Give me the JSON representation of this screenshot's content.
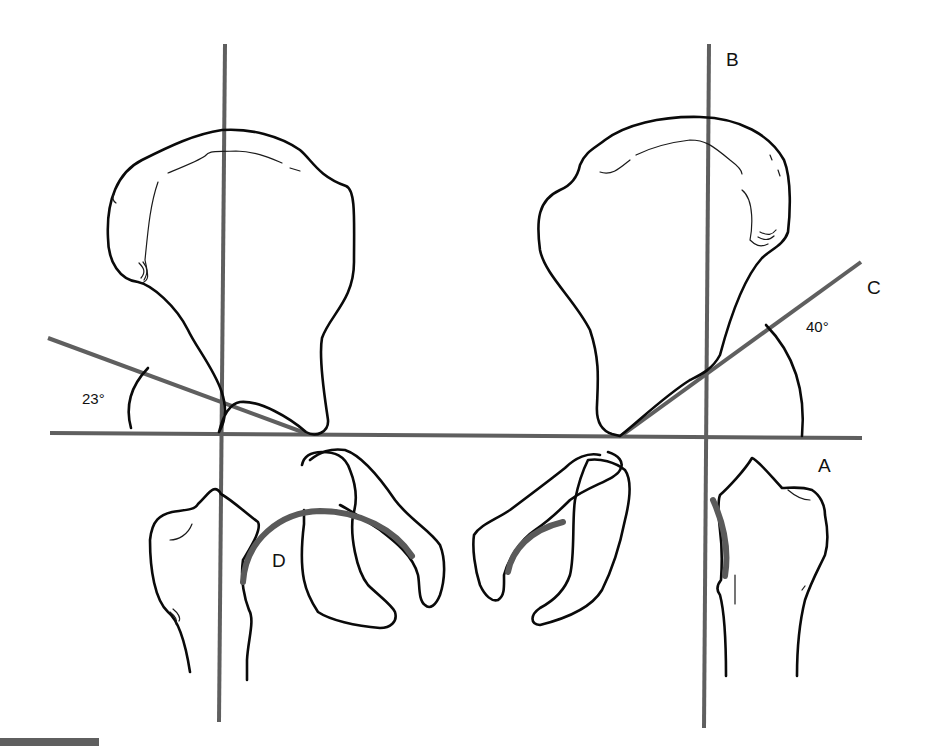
{
  "figure": {
    "type": "anatomical line drawing",
    "labels": {
      "A": "A",
      "B": "B",
      "C": "C",
      "D": "D"
    },
    "angles": {
      "left": "23°",
      "right": "40°"
    },
    "colors": {
      "reference_lines": "#5f5f5f",
      "bone_outlines": "#0a0a0a",
      "articular_surface": "#5a5a5a",
      "background": "#ffffff"
    },
    "scale_bar": {
      "visible": true
    }
  }
}
